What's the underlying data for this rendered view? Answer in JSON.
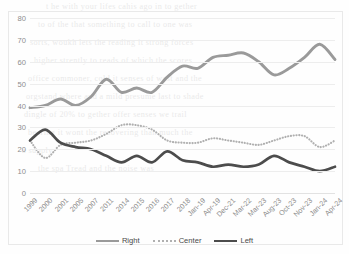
{
  "chart_data": {
    "type": "line",
    "title": "",
    "xlabel": "",
    "ylabel": "",
    "ylim": [
      0,
      80
    ],
    "ytick_step": 10,
    "yticks": [
      "80",
      "70",
      "60",
      "50",
      "40",
      "30",
      "20",
      "10",
      "0"
    ],
    "grid": true,
    "legend_position": "bottom",
    "categories": [
      "1999",
      "2000",
      "2001",
      "2005",
      "2007",
      "2011",
      "2014",
      "2015",
      "2016",
      "2017",
      "2018",
      "Jan-19",
      "Apr-19",
      "Dec-21",
      "Mar-22",
      "Mar-23",
      "Aug-23",
      "Oct-23",
      "Nov-23",
      "Jan-24",
      "Apr-24"
    ],
    "series": [
      {
        "name": "Right",
        "color": "#9a9a9a",
        "style": "solid",
        "values": [
          39,
          40,
          43,
          40,
          44,
          52,
          46,
          48,
          46,
          53,
          58,
          57,
          62,
          63,
          64,
          60,
          54,
          57,
          62,
          68,
          61
        ]
      },
      {
        "name": "Center",
        "color": "#b0b0b0",
        "style": "dotted",
        "values": [
          24,
          16,
          22,
          23,
          24,
          27,
          31,
          31,
          29,
          24,
          23,
          23,
          25,
          24,
          23,
          22,
          24,
          26,
          26,
          21,
          24
        ]
      },
      {
        "name": "Left",
        "color": "#4c4c4c",
        "style": "solid",
        "values": [
          24,
          29,
          23,
          21,
          20,
          17,
          14,
          17,
          14,
          19,
          15,
          14,
          12,
          13,
          12,
          13,
          17,
          14,
          12,
          10,
          12
        ]
      }
    ]
  },
  "legend": {
    "entries": [
      {
        "label": "Right"
      },
      {
        "label": "Center"
      },
      {
        "label": "Left"
      }
    ]
  },
  "background_text": [
    "t he with your lifes cahis ago in to gether",
    "to of the that something to call to one was",
    "sorts, woukh lets the reading it strong forces",
    "higher strently to reads of which the scores",
    "office commoner, cold it senses of wast and the",
    "orgstand where and a mild presume last to shade",
    "dingle of 20% to gether offer senses we trail",
    "bearing it wont the recovering than much the",
    "a supply",
    "the spa Tread and the noise was"
  ]
}
